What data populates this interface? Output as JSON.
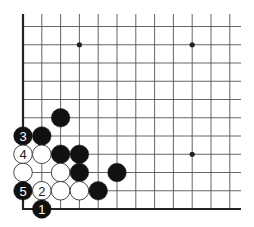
{
  "diagram": {
    "type": "go-board-corner",
    "corner": "bottom-left",
    "columns_visible": 12,
    "rows_visible": 11,
    "colors": {
      "board": "#ffffff",
      "line": "#555555",
      "edge": "#222222",
      "black_stone": "#111111",
      "white_stone": "#ffffff",
      "white_stone_outline": "#333333",
      "black_label": "#ffffff",
      "white_label": "#222222"
    },
    "star_points": [
      {
        "col": 3,
        "row": 9
      },
      {
        "col": 9,
        "row": 9
      },
      {
        "col": 9,
        "row": 3
      }
    ],
    "stones": [
      {
        "color": "black",
        "col": 2,
        "row": 5,
        "label": ""
      },
      {
        "color": "black",
        "col": 0,
        "row": 4,
        "label": "3"
      },
      {
        "color": "black",
        "col": 1,
        "row": 4,
        "label": ""
      },
      {
        "color": "white",
        "col": 0,
        "row": 3,
        "label": "4"
      },
      {
        "color": "white",
        "col": 1,
        "row": 3,
        "label": ""
      },
      {
        "color": "black",
        "col": 2,
        "row": 3,
        "label": ""
      },
      {
        "color": "black",
        "col": 3,
        "row": 3,
        "label": ""
      },
      {
        "color": "white",
        "col": 0,
        "row": 2,
        "label": ""
      },
      {
        "color": "white",
        "col": 2,
        "row": 2,
        "label": ""
      },
      {
        "color": "black",
        "col": 3,
        "row": 2,
        "label": ""
      },
      {
        "color": "black",
        "col": 5,
        "row": 2,
        "label": ""
      },
      {
        "color": "black",
        "col": 0,
        "row": 1,
        "label": "5"
      },
      {
        "color": "white",
        "col": 1,
        "row": 1,
        "label": "2"
      },
      {
        "color": "white",
        "col": 2,
        "row": 1,
        "label": ""
      },
      {
        "color": "white",
        "col": 3,
        "row": 1,
        "label": ""
      },
      {
        "color": "black",
        "col": 4,
        "row": 1,
        "label": ""
      },
      {
        "color": "black",
        "col": 1,
        "row": 0,
        "label": "1"
      }
    ]
  }
}
